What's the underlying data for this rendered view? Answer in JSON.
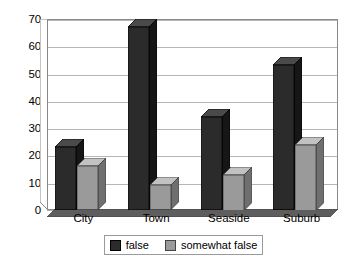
{
  "chart_data": {
    "type": "bar",
    "title": "",
    "subtitle": "",
    "xlabel": "",
    "ylabel": "",
    "categories": [
      "City",
      "Town",
      "Seaside",
      "Suburb"
    ],
    "series": [
      {
        "name": "false",
        "values": [
          23,
          67,
          34,
          53
        ],
        "color": "#2b2b2b"
      },
      {
        "name": "somewhat false",
        "values": [
          16,
          9,
          13,
          24
        ],
        "color": "#9a9a9a"
      }
    ],
    "ylim": [
      0,
      70
    ],
    "yticks": [
      0,
      10,
      20,
      30,
      40,
      50,
      60,
      70
    ],
    "ytick_labels": [
      "0",
      "10",
      "20",
      "30",
      "40",
      "50",
      "60",
      "70"
    ],
    "grid": true,
    "grid_axis": "y",
    "legend_position": "bottom",
    "style": "3d-column"
  },
  "legend": {
    "items": [
      {
        "label": "false",
        "color": "#2b2b2b"
      },
      {
        "label": "somewhat false",
        "color": "#9a9a9a"
      }
    ]
  }
}
